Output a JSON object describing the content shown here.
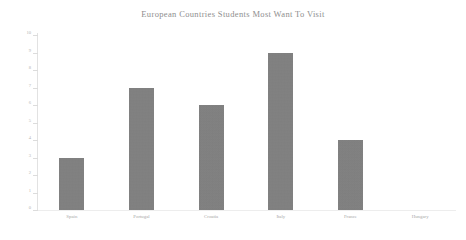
{
  "chart_data": {
    "type": "bar",
    "title": "European Countries Students Most Want To Visit",
    "xlabel": "",
    "ylabel": "",
    "categories": [
      "Spain",
      "Portugal",
      "Croatia",
      "Italy",
      "France",
      "Hungary"
    ],
    "values": [
      3,
      7,
      6,
      9,
      4,
      0
    ],
    "ylim": [
      0,
      10
    ],
    "ytick_step": 1,
    "yticks": [
      "0",
      "1",
      "2",
      "3",
      "4",
      "5",
      "6",
      "7",
      "8",
      "9",
      "10"
    ],
    "grid": false,
    "legend": null,
    "bar_color": "#808080",
    "title_color": "#8e8e8e",
    "tick_label_color": "#b4b4b4",
    "category_label_color": "#a8a8a8",
    "background_color": "#ffffff"
  }
}
